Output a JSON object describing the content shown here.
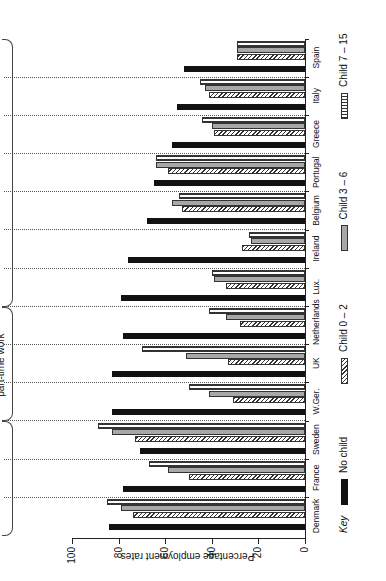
{
  "chart_data": {
    "type": "bar",
    "orientation": "rotated 90° counter-clockwise (vertical bars shown sideways)",
    "title": "",
    "ylabel": "Percentage employment rates",
    "xlabel": "",
    "ylim": [
      0,
      100
    ],
    "yticks": [
      0,
      20,
      40,
      60,
      80,
      100
    ],
    "grid": false,
    "categories": [
      "Denmark",
      "France",
      "Sweden",
      "W.Ger.",
      "UK",
      "Netherlands",
      "Lux.",
      "Ireland",
      "Belgium",
      "Portugal",
      "Greece",
      "Italy",
      "Spain"
    ],
    "series": [
      {
        "name": "No child",
        "pattern": "solid-black",
        "values": [
          84,
          78,
          71,
          83,
          83,
          78,
          79,
          76,
          68,
          65,
          57,
          55,
          52
        ]
      },
      {
        "name": "Child 0 – 2",
        "pattern": "diagonal-hatch",
        "values": [
          74,
          50,
          73,
          31,
          33,
          28,
          34,
          27,
          53,
          59,
          39,
          41,
          29
        ]
      },
      {
        "name": "Child 3 – 6",
        "pattern": "dotted",
        "values": [
          79,
          59,
          83,
          41,
          51,
          34,
          39,
          23,
          57,
          64,
          40,
          43,
          29
        ]
      },
      {
        "name": "Child 7 – 15",
        "pattern": "vertical-stripes",
        "values": [
          85,
          67,
          89,
          50,
          70,
          41,
          40,
          24,
          54,
          64,
          44,
          45,
          29
        ]
      }
    ],
    "groups": [
      {
        "title": "GROUP 1",
        "subtitle": "Dual role throughout working life",
        "countries": [
          "Denmark",
          "France",
          "Sweden"
        ]
      },
      {
        "title": "GROUP 2",
        "subtitle": "Dual role with homemaker/ part-time work",
        "countries": [
          "W.Ger.",
          "UK",
          "Netherlands"
        ]
      },
      {
        "title": "GROUP 3",
        "subtitle": "Homemaker",
        "countries": [
          "Lux.",
          "Ireland",
          "Belgium",
          "Portugal",
          "Greece",
          "Italy",
          "Spain"
        ]
      }
    ],
    "legend": {
      "title": "Key",
      "position": "bottom",
      "entries": [
        "No child",
        "Child 0 – 2",
        "Child 3 – 6",
        "Child 7 – 15"
      ]
    }
  },
  "axis": {
    "ylabel": "Percentage employment rates",
    "ticks": [
      "0",
      "20",
      "40",
      "60",
      "80",
      "100"
    ]
  },
  "groups": [
    {
      "title": "GROUP 1",
      "line1": "Dual role throughout",
      "line2": "working life"
    },
    {
      "title": "GROUP 2",
      "line1": "Dual role with homemaker/",
      "line2": "part-time work"
    },
    {
      "title": "GROUP 3",
      "line1": "Homemaker",
      "line2": ""
    }
  ],
  "key": {
    "title": "Key",
    "labels": [
      "No child",
      "Child 0 – 2",
      "Child 3 – 6",
      "Child 7 – 15"
    ]
  }
}
